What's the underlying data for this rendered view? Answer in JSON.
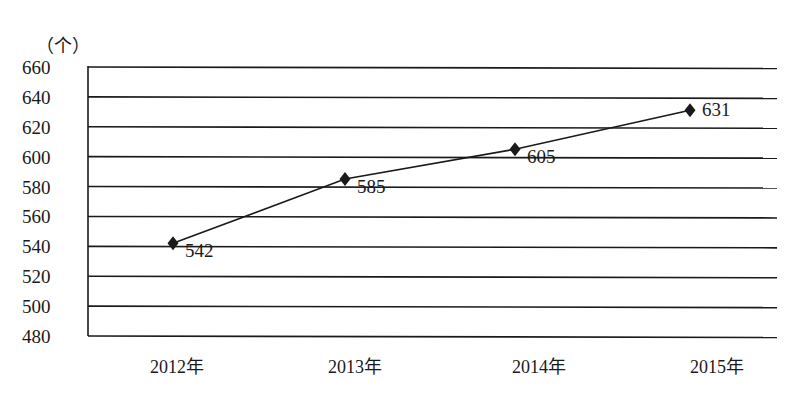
{
  "chart_data": {
    "type": "line",
    "title": "",
    "xlabel": "",
    "ylabel": "（个）",
    "categories": [
      "2012年",
      "2013年",
      "2014年",
      "2015年"
    ],
    "series": [
      {
        "name": "",
        "values": [
          542,
          585,
          605,
          631
        ],
        "marker": "diamond",
        "color": "#1a1a1a"
      }
    ],
    "data_labels": [
      "542",
      "585",
      "605",
      "631"
    ],
    "ylim": [
      480,
      660
    ],
    "yticks": [
      480,
      500,
      520,
      540,
      560,
      580,
      600,
      620,
      640,
      660
    ],
    "ytick_labels": [
      "480",
      "500",
      "520",
      "540",
      "560",
      "580",
      "600",
      "620",
      "640",
      "660"
    ],
    "grid": true,
    "legend": "none"
  },
  "colors": {
    "line": "#1a1a1a",
    "grid": "#1a1a1a",
    "text": "#1a1a1a",
    "background": "#ffffff"
  }
}
